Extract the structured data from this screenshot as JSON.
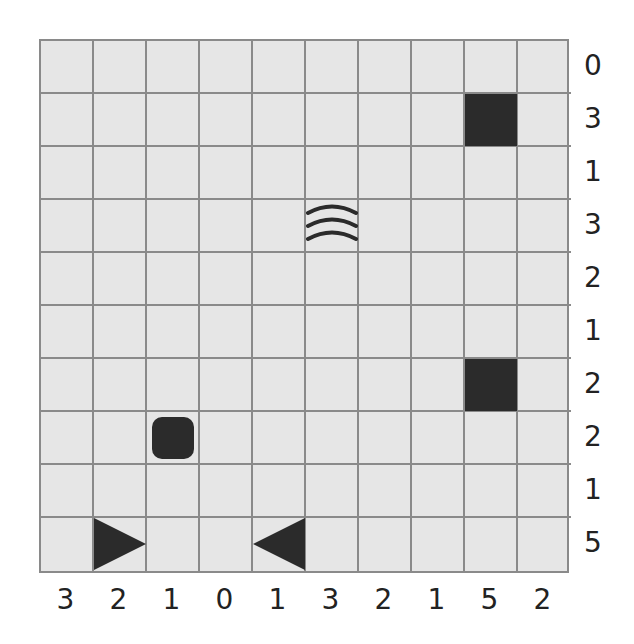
{
  "puzzle": {
    "type": "battleships",
    "rows": 10,
    "cols": 10,
    "row_clues": [
      "0",
      "3",
      "1",
      "3",
      "2",
      "1",
      "2",
      "2",
      "1",
      "5"
    ],
    "col_clues": [
      "3",
      "2",
      "1",
      "0",
      "1",
      "3",
      "2",
      "1",
      "5",
      "2"
    ],
    "given_cells": [
      {
        "row": 1,
        "col": 8,
        "kind": "ship-middle"
      },
      {
        "row": 3,
        "col": 5,
        "kind": "water"
      },
      {
        "row": 6,
        "col": 8,
        "kind": "ship-middle"
      },
      {
        "row": 7,
        "col": 2,
        "kind": "ship-single"
      },
      {
        "row": 9,
        "col": 1,
        "kind": "ship-end-right"
      },
      {
        "row": 9,
        "col": 4,
        "kind": "ship-end-left"
      }
    ],
    "colors": {
      "cell_bg": "#e6e6e6",
      "grid_line": "#8a8a8a",
      "piece": "#2b2b2b"
    }
  }
}
